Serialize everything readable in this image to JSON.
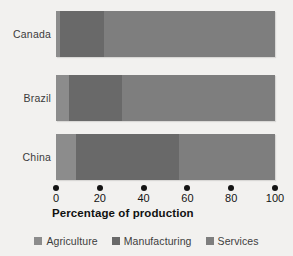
{
  "chart_data": {
    "type": "bar",
    "orientation": "horizontal",
    "stacked": true,
    "title": "",
    "xlabel": "Percentage of production",
    "ylabel": "",
    "xlim": [
      0,
      100
    ],
    "xticks": [
      0,
      20,
      40,
      60,
      80,
      100
    ],
    "xtick_labels": [
      "0",
      "20",
      "40",
      "60",
      "80",
      "100"
    ],
    "grid": false,
    "legend_position": "bottom",
    "categories": [
      "Canada",
      "Brazil",
      "China"
    ],
    "series": [
      {
        "name": "Agriculture",
        "color": "#8c8c8c",
        "values": [
          2,
          6,
          9
        ]
      },
      {
        "name": "Manufacturing",
        "color": "#696969",
        "values": [
          20,
          24,
          47
        ]
      },
      {
        "name": "Services",
        "color": "#7e7e7e",
        "values": [
          78,
          70,
          44
        ]
      }
    ]
  },
  "axis": {
    "title": "Percentage of production",
    "ticks": [
      "0",
      "20",
      "40",
      "60",
      "80",
      "100"
    ]
  },
  "categories": {
    "c0": "Canada",
    "c1": "Brazil",
    "c2": "China"
  },
  "legend": {
    "items": [
      {
        "label": "Agriculture",
        "color": "#8c8c8c"
      },
      {
        "label": "Manufacturing",
        "color": "#696969"
      },
      {
        "label": "Services",
        "color": "#7e7e7e"
      }
    ]
  }
}
